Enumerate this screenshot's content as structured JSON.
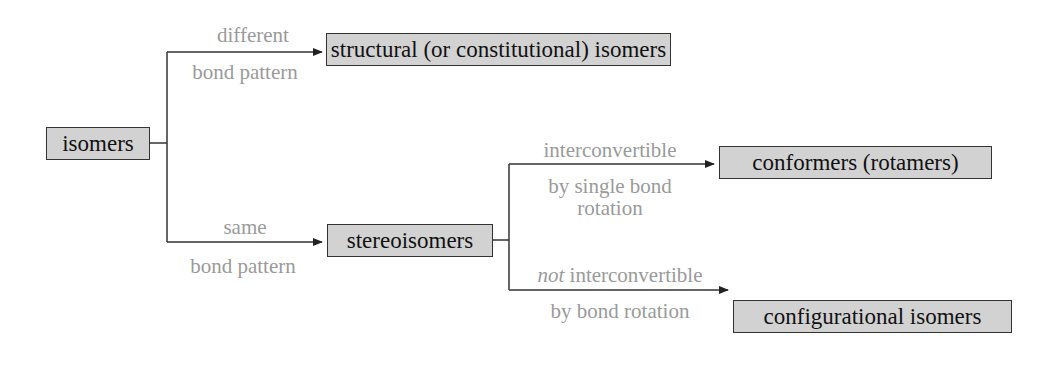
{
  "diagram": {
    "nodes": {
      "root": "isomers",
      "structural": "structural (or constitutional) isomers",
      "stereo": "stereoisomers",
      "conformers": "conformers (rotamers)",
      "configurational": "configurational isomers"
    },
    "edges": {
      "to_structural": {
        "above": "different",
        "below": "bond pattern"
      },
      "to_stereo": {
        "above": "same",
        "below": "bond pattern"
      },
      "to_conformers": {
        "above": "interconvertible",
        "below_line1": "by single bond",
        "below_line2": "rotation"
      },
      "to_configurational": {
        "above_italic": "not",
        "above": " interconvertible",
        "below": "by bond rotation"
      }
    },
    "colors": {
      "box_fill": "#d2d2d2",
      "box_border": "#333333",
      "label_text": "#9a9a9a",
      "line": "#333333"
    }
  }
}
